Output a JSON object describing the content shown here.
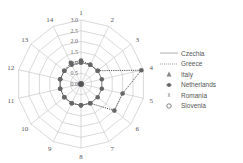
{
  "chart_data": {
    "type": "radar",
    "title": "",
    "axes": [
      "1",
      "2",
      "3",
      "4",
      "5",
      "6",
      "7",
      "8",
      "9",
      "10",
      "11",
      "12",
      "13",
      "14"
    ],
    "ring_labels": [
      "0.0",
      "0.5",
      "1.0",
      "1.5",
      "2.0",
      "2.5",
      "3.0"
    ],
    "rlim": [
      0,
      3.0
    ],
    "series": [
      {
        "name": "Czechia",
        "style": "solid",
        "values": [
          1.0,
          1.0,
          1.0,
          1.0,
          1.0,
          1.0,
          1.0,
          1.0,
          1.0,
          1.0,
          1.0,
          1.0,
          1.0,
          1.0
        ]
      },
      {
        "name": "Greece",
        "style": "dotted",
        "values": [
          1.1,
          1.0,
          1.0,
          2.9,
          2.0,
          2.0,
          1.0,
          1.0,
          1.0,
          1.0,
          1.0,
          1.0,
          1.0,
          1.1
        ]
      },
      {
        "name": "Italy",
        "marker": "triangle",
        "values": [
          0,
          0,
          0,
          0,
          0,
          0,
          0,
          0,
          0,
          0,
          0,
          0,
          0,
          0
        ]
      },
      {
        "name": "Netherlands",
        "marker": "star",
        "values": [
          0,
          0,
          0,
          2.9,
          0,
          0,
          0,
          0.5,
          0,
          0,
          0,
          0,
          0,
          0
        ]
      },
      {
        "name": "Romania",
        "marker": "x",
        "values": [
          0,
          0,
          0,
          0,
          0,
          0,
          0,
          0,
          0,
          0,
          0,
          0,
          0,
          0
        ]
      },
      {
        "name": "Slovenia",
        "marker": "circle",
        "values": [
          0,
          0,
          0,
          0,
          0,
          0,
          0,
          0,
          0,
          0,
          0,
          0,
          0,
          0
        ]
      }
    ],
    "grid": true,
    "legend_position": "right"
  },
  "legend": [
    {
      "label": "Czechia",
      "symbol": "solid-line"
    },
    {
      "label": "Greece",
      "symbol": "dotted-line"
    },
    {
      "label": "Italy",
      "symbol": "triangle"
    },
    {
      "label": "Netherlands",
      "symbol": "star"
    },
    {
      "label": "Romania",
      "symbol": "x"
    },
    {
      "label": "Slovenia",
      "symbol": "circle"
    }
  ]
}
